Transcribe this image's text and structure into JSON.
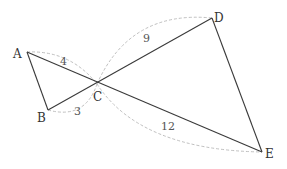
{
  "diagram": {
    "type": "geometry",
    "points": {
      "A": {
        "label": "A",
        "x": 27,
        "y": 52
      },
      "B": {
        "label": "B",
        "x": 48,
        "y": 110
      },
      "C": {
        "label": "C",
        "x": 97,
        "y": 84
      },
      "D": {
        "label": "D",
        "x": 212,
        "y": 18
      },
      "E": {
        "label": "E",
        "x": 262,
        "y": 152
      }
    },
    "segments": [
      "AB",
      "AE",
      "BD",
      "DE"
    ],
    "lengths": {
      "AC": "4",
      "BC": "3",
      "CD": "9",
      "CE": "12"
    }
  }
}
